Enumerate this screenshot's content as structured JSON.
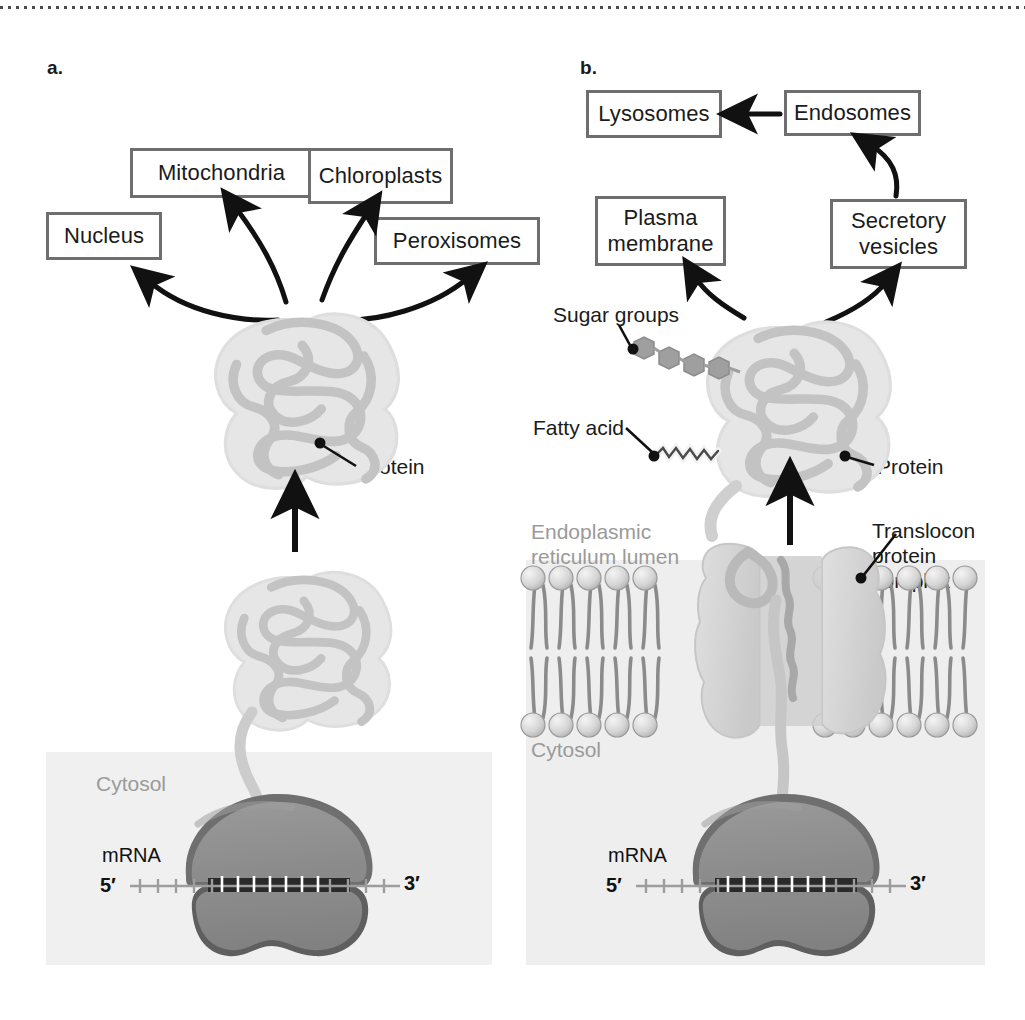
{
  "figure": {
    "panels": [
      {
        "id": "a",
        "letter": "a.",
        "description": "Cytosolic ribosome synthesizes a protein that folds in the cytosol and is targeted to organelles",
        "destination_boxes": [
          {
            "name": "nucleus-box",
            "label": "Nucleus"
          },
          {
            "name": "mitochondria-box",
            "label": "Mitochondria"
          },
          {
            "name": "chloroplasts-box",
            "label": "Chloroplasts"
          },
          {
            "name": "peroxisomes-box",
            "label": "Peroxisomes"
          }
        ],
        "callouts": [
          {
            "name": "protein-callout",
            "label": "Protein"
          },
          {
            "name": "cytosol-callout",
            "label": "Cytosol"
          },
          {
            "name": "mrna-callout",
            "label": "mRNA"
          }
        ],
        "mrna": {
          "five_prime": "5′",
          "three_prime": "3′",
          "tick_count": 34
        }
      },
      {
        "id": "b",
        "letter": "b.",
        "description": "ER-bound ribosome translocates a protein into the ER lumen where it is glycosylated and lipid-modified, then routed to the secretory pathway",
        "destination_boxes": [
          {
            "name": "lysosomes-box",
            "label": "Lysosomes"
          },
          {
            "name": "endosomes-box",
            "label": "Endosomes"
          },
          {
            "name": "plasma-membrane-box",
            "label": "Plasma\nmembrane"
          },
          {
            "name": "secretory-vesicles-box",
            "label": "Secretory\nvesicles"
          }
        ],
        "callouts": [
          {
            "name": "sugar-groups-callout",
            "label": "Sugar groups"
          },
          {
            "name": "fatty-acid-callout",
            "label": "Fatty acid"
          },
          {
            "name": "protein-callout",
            "label": "Protein"
          },
          {
            "name": "translocon-callout",
            "label": "Translocon\nprotein\ncomplex"
          },
          {
            "name": "er-lumen-callout",
            "label": "Endoplasmic\nreticulum lumen"
          },
          {
            "name": "cytosol-callout",
            "label": "Cytosol"
          },
          {
            "name": "mrna-callout",
            "label": "mRNA"
          }
        ],
        "mrna": {
          "five_prime": "5′",
          "three_prime": "3′",
          "tick_count": 34
        },
        "sugar_units": 4,
        "membrane": {
          "lipid_heads_per_leaflet": 13
        }
      }
    ]
  },
  "colors": {
    "box_border": "#6e6e6e",
    "text": "#1b1b1b",
    "muted_text": "#9a9a9a",
    "arrow": "#111111",
    "protein_fill": "#e3e3e3",
    "protein_chain": "#c6c6c6",
    "ribosome_large": "#8c8c8c",
    "ribosome_small": "#8a8a8a",
    "ribosome_shadow": "#6b6b6b",
    "membrane_lipid": "#8f8f8f",
    "lipid_head": "#d8d8d8",
    "translocon": "#d5d5d5",
    "sugar": "#9b9b9b",
    "panel_tint": "#f0f0f0",
    "rule": "#2b2b2b"
  }
}
